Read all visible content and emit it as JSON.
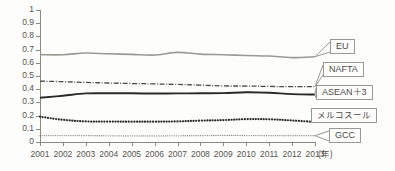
{
  "chart_data": {
    "type": "line",
    "title": "",
    "xlabel": "(年)",
    "ylabel": "",
    "ylim": [
      0,
      1
    ],
    "xlim": [
      2001,
      2013
    ],
    "grid": false,
    "legend_position": "right-callout",
    "x": [
      2001,
      2002,
      2003,
      2004,
      2005,
      2006,
      2007,
      2008,
      2009,
      2010,
      2011,
      2012,
      2013
    ],
    "categories": [
      "2001",
      "2002",
      "2003",
      "2004",
      "2005",
      "2006",
      "2007",
      "2008",
      "2009",
      "2010",
      "2011",
      "2012",
      "2013"
    ],
    "ytick_labels": [
      "1",
      "0.9",
      "0.8",
      "0.7",
      "0.6",
      "0.5",
      "0.4",
      "0.3",
      "0.2",
      "0.1",
      "0"
    ],
    "ytick_values": [
      1,
      0.9,
      0.8,
      0.7,
      0.6,
      0.5,
      0.4,
      0.3,
      0.2,
      0.1,
      0
    ],
    "series": [
      {
        "name": "EU",
        "label_jp": "EU",
        "color": "#9a9a94",
        "style": "solid",
        "width": 1.6,
        "values": [
          0.662,
          0.661,
          0.674,
          0.668,
          0.664,
          0.659,
          0.679,
          0.666,
          0.661,
          0.655,
          0.651,
          0.639,
          0.646
        ]
      },
      {
        "name": "NAFTA",
        "label_jp": "NAFTA",
        "color": "#4a4a46",
        "style": "dash-dot",
        "width": 1.3,
        "values": [
          0.461,
          0.457,
          0.451,
          0.447,
          0.443,
          0.44,
          0.436,
          0.431,
          0.425,
          0.424,
          0.421,
          0.419,
          0.42
        ]
      },
      {
        "name": "ASEAN+3",
        "label_jp": "ASEAN＋3",
        "color": "#2a2a26",
        "style": "solid",
        "width": 1.9,
        "values": [
          0.335,
          0.35,
          0.368,
          0.369,
          0.369,
          0.367,
          0.368,
          0.369,
          0.37,
          0.377,
          0.373,
          0.363,
          0.36
        ]
      },
      {
        "name": "Mercosur",
        "label_jp": "メルコスール",
        "color": "#2a2a26",
        "style": "dotted-thick",
        "width": 2.2,
        "values": [
          0.192,
          0.168,
          0.156,
          0.155,
          0.154,
          0.154,
          0.156,
          0.162,
          0.166,
          0.173,
          0.172,
          0.163,
          0.152
        ]
      },
      {
        "name": "GCC",
        "label_jp": "GCC",
        "color": "#8a8a85",
        "style": "dotted-fine",
        "width": 1.3,
        "values": [
          0.048,
          0.049,
          0.048,
          0.047,
          0.046,
          0.046,
          0.047,
          0.048,
          0.05,
          0.049,
          0.048,
          0.048,
          0.048
        ]
      }
    ]
  },
  "legend_boxes": [
    {
      "label": "EU",
      "jp": false
    },
    {
      "label": "NAFTA",
      "jp": false
    },
    {
      "label": "ASEAN＋3",
      "jp": false
    },
    {
      "label": "メルコスール",
      "jp": true
    },
    {
      "label": "GCC",
      "jp": false
    }
  ],
  "axis": {
    "x_unit": "(年)"
  },
  "colors": {
    "background": "#fdfdfb",
    "axis": "#8a8a85",
    "text": "#555550",
    "eu": "#9a9a94",
    "nafta": "#4a4a46",
    "asean3": "#2a2a26",
    "mercosur": "#2a2a26",
    "gcc": "#8a8a85"
  }
}
